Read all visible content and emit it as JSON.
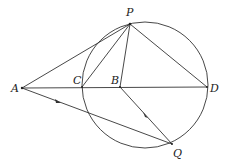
{
  "diagram": {
    "type": "geometry",
    "circle": {
      "cx": 145,
      "cy": 85,
      "r": 63
    },
    "points": {
      "P": {
        "x": 130,
        "y": 24,
        "label": "P",
        "lx": 126,
        "ly": 16
      },
      "A": {
        "x": 22,
        "y": 88,
        "label": "A",
        "lx": 11,
        "ly": 92
      },
      "C": {
        "x": 82,
        "y": 87,
        "label": "C",
        "lx": 73,
        "ly": 83
      },
      "B": {
        "x": 120,
        "y": 87,
        "label": "B",
        "lx": 111,
        "ly": 83
      },
      "D": {
        "x": 207,
        "y": 87,
        "label": "D",
        "lx": 210,
        "ly": 92
      },
      "Q": {
        "x": 172,
        "y": 144,
        "label": "Q",
        "lx": 173,
        "ly": 157
      }
    },
    "segments": [
      [
        "A",
        "P"
      ],
      [
        "A",
        "D"
      ],
      [
        "A",
        "Q"
      ],
      [
        "C",
        "P"
      ],
      [
        "B",
        "P"
      ],
      [
        "P",
        "D"
      ],
      [
        "B",
        "Q"
      ]
    ],
    "labels": [
      "P",
      "A",
      "C",
      "B",
      "D",
      "Q"
    ]
  }
}
